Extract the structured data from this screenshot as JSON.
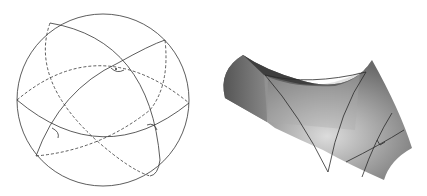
{
  "figure": {
    "panels": [
      {
        "name": "spherical-geometry",
        "shape": "sphere",
        "description": "Sphere with great circles forming a triangle with marked angles"
      },
      {
        "name": "hyperbolic-geometry",
        "shape": "saddle-surface",
        "description": "Saddle surface with hyperbolic triangle and marked right angle"
      }
    ],
    "colors": {
      "line": "#333333",
      "dashed": "#555555",
      "surface_dark": "#4a4a4a",
      "surface_light": "#d8d8d8"
    }
  }
}
